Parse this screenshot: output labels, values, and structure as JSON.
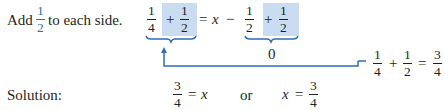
{
  "step": {
    "instruction_prefix": "Add",
    "instruction_fraction": {
      "numerator": "1",
      "denominator": "2"
    },
    "instruction_suffix": "to each side.",
    "equation": {
      "left": {
        "term1": {
          "numerator": "1",
          "denominator": "4"
        },
        "plus": "+",
        "term2": {
          "numerator": "1",
          "denominator": "2"
        }
      },
      "equals": "=",
      "variable": "x",
      "minus": "−",
      "right": {
        "term1": {
          "numerator": "1",
          "denominator": "2"
        },
        "plus": "+",
        "term2": {
          "numerator": "1",
          "denominator": "2"
        }
      },
      "right_brace_result": "0"
    },
    "annotation": {
      "term1": {
        "numerator": "1",
        "denominator": "4"
      },
      "plus": "+",
      "term2": {
        "numerator": "1",
        "denominator": "2"
      },
      "equals": "=",
      "result": {
        "numerator": "3",
        "denominator": "4"
      }
    }
  },
  "solution": {
    "label": "Solution:",
    "form1": {
      "fraction": {
        "numerator": "3",
        "denominator": "4"
      },
      "equals": "=",
      "variable": "x"
    },
    "connector": "or",
    "form2": {
      "variable": "x",
      "equals": "=",
      "fraction": {
        "numerator": "3",
        "denominator": "4"
      }
    }
  },
  "colors": {
    "accent": "#2f6fb3",
    "highlight": "#c9dcf0",
    "text": "#231f20"
  }
}
